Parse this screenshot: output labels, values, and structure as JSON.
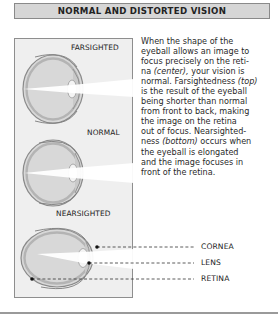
{
  "title": "NORMAL AND DISTORTED VISION",
  "figure": {
    "labels": {
      "farsighted": "FARSIGHTED",
      "normal": "NORMAL",
      "nearsighted": "NEARSIGHTED"
    },
    "callouts": [
      {
        "label": "CORNEA"
      },
      {
        "label": "LENS"
      },
      {
        "label": "RETINA"
      }
    ]
  },
  "body": {
    "lines": [
      [
        "When the shape of the"
      ],
      [
        "eyeball allows an image to"
      ],
      [
        "focus precisely on the reti-"
      ],
      [
        "na ",
        {
          "em": "(center),"
        },
        " your vision is"
      ],
      [
        "normal. Farsightedness ",
        {
          "em": "(top)"
        }
      ],
      [
        "is the result of the eyeball"
      ],
      [
        "being shorter than normal"
      ],
      [
        "from front to back, making"
      ],
      [
        "the image on the retina"
      ],
      [
        "out of focus. Nearsighted-"
      ],
      [
        "ness ",
        {
          "em": "(bottom)"
        },
        " occurs when"
      ],
      [
        "the eyeball is elongated"
      ],
      [
        "and the image focuses in"
      ],
      [
        "front of the retina."
      ]
    ],
    "l0": "When the shape of the",
    "l1": "eyeball allows an image to",
    "l2": "focus precisely on the reti-",
    "l3a": "na ",
    "l3em": "(center),",
    "l3b": " your vision is",
    "l4a": "normal. Farsightedness ",
    "l4em": "(top)",
    "l5": "is the result of the eyeball",
    "l6": "being shorter than normal",
    "l7": "from front to back, making",
    "l8": "the image on the retina",
    "l9": "out of focus. Nearsighted-",
    "l10a": "ness ",
    "l10em": "(bottom)",
    "l10b": " occurs when",
    "l11": "the eyeball is elongated",
    "l12": "and the image focuses in",
    "l13": "front of the retina."
  },
  "colors": {
    "title_fill": "#d6d6d6",
    "panel_fill": "#efefef",
    "eye_interior": "#dcdcdc",
    "eye_wall": "#9a9a9a",
    "light_beam": "#ffffff"
  }
}
